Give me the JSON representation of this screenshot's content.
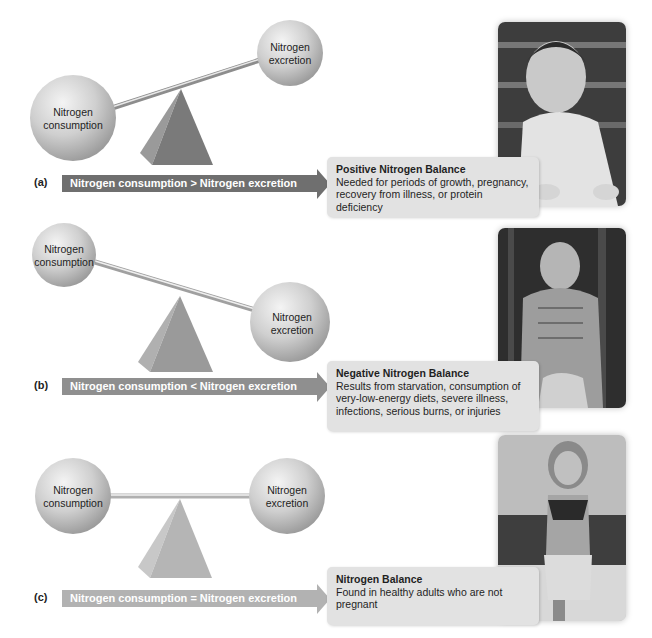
{
  "figure": {
    "panels": [
      {
        "letter": "(a)",
        "left_sphere_label": [
          "Nitrogen",
          "consumption"
        ],
        "right_sphere_label": [
          "Nitrogen",
          "excretion"
        ],
        "relation": "Nitrogen consumption > Nitrogen excretion",
        "balance_title": "Positive Nitrogen Balance",
        "balance_lines": [
          "Needed for periods of growth, pregnancy,",
          "recovery from illness, or protein deficiency"
        ],
        "photo": "crawling-baby-photo",
        "arrow_color": "#6f6f6f",
        "pyramid_color": "#7a7a7a"
      },
      {
        "letter": "(b)",
        "left_sphere_label": [
          "Nitrogen",
          "consumption"
        ],
        "right_sphere_label": [
          "Nitrogen",
          "excretion"
        ],
        "relation": "Nitrogen consumption < Nitrogen excretion",
        "balance_title": "Negative Nitrogen Balance",
        "balance_lines": [
          "Results from starvation, consumption of",
          "very-low-energy diets, severe illness,",
          "infections, serious burns, or injuries"
        ],
        "photo": "emaciated-man-photo",
        "arrow_color": "#8f8f8f",
        "pyramid_color": "#9a9a9a"
      },
      {
        "letter": "(c)",
        "left_sphere_label": [
          "Nitrogen",
          "consumption"
        ],
        "right_sphere_label": [
          "Nitrogen",
          "excretion"
        ],
        "relation": "Nitrogen consumption = Nitrogen excretion",
        "balance_title": "Nitrogen Balance",
        "balance_lines": [
          "Found in healthy adults who are not",
          "pregnant"
        ],
        "photo": "running-woman-photo",
        "arrow_color": "#b2b2b2",
        "pyramid_color": "#b5b5b5"
      }
    ]
  }
}
